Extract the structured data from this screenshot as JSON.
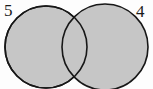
{
  "diagram": {
    "type": "venn-two-set",
    "background_color": "#fdfdfd",
    "fill_color": "#c6c6c6",
    "stroke_color": "#171717",
    "stroke_width": 1.6,
    "labels": {
      "left": "5",
      "right": "4"
    },
    "left_circle": {
      "label": "5",
      "cx": 46,
      "cy": 47,
      "r": 41
    },
    "right_circle": {
      "label": "4",
      "cx": 105,
      "cy": 47,
      "r": 43
    }
  },
  "chart_data": {
    "type": "diagram",
    "subtype": "venn",
    "title": "",
    "categories": [
      "5",
      "4"
    ],
    "values": [
      5,
      4
    ],
    "regions": [
      {
        "name": "left-only",
        "label": "5"
      },
      {
        "name": "intersection",
        "label": ""
      },
      {
        "name": "right-only",
        "label": "4"
      }
    ],
    "legend": [],
    "xlabel": "",
    "ylabel": ""
  }
}
